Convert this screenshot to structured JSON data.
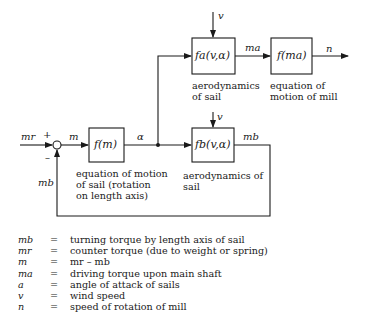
{
  "diagram": {
    "blocks": {
      "fa": {
        "label": "fa(v,α)",
        "caption": "aerodynamics\nof sail"
      },
      "fma": {
        "label": "f(ma)",
        "caption": "equation of\nmotion of mill"
      },
      "fm": {
        "label": "f(m)",
        "caption": "equation of motion\nof sail (rotation\non length axis)"
      },
      "fb": {
        "label": "fb(v,α)",
        "caption": "aerodynamics of\nsail"
      }
    },
    "signals": {
      "v_top": "v",
      "v_mid": "v",
      "ma": "ma",
      "n": "n",
      "mr": "mr",
      "plus": "+",
      "minus": "–",
      "m": "m",
      "alpha": "α",
      "mb_out": "mb",
      "mb_fb": "mb"
    }
  },
  "legend": [
    {
      "symbol": "mb",
      "eq": "=",
      "desc": "turning torque by length axis of sail"
    },
    {
      "symbol": "mr",
      "eq": "=",
      "desc": "counter torque (due to weight or spring)"
    },
    {
      "symbol": "m",
      "eq": "=",
      "desc": "mr – mb"
    },
    {
      "symbol": "ma",
      "eq": "=",
      "desc": "driving torque upon main shaft"
    },
    {
      "symbol": "a",
      "eq": "=",
      "desc": "angle of attack of sails"
    },
    {
      "symbol": "v",
      "eq": "=",
      "desc": "wind speed"
    },
    {
      "symbol": "n",
      "eq": "=",
      "desc": "speed of rotation of mill"
    }
  ]
}
